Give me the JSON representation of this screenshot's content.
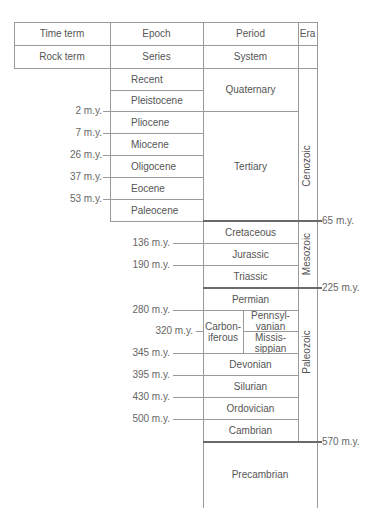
{
  "header": {
    "row1": [
      "Time term",
      "Epoch",
      "Period",
      "Era"
    ],
    "row2": [
      "Rock term",
      "Series",
      "System",
      ""
    ]
  },
  "epochs": [
    "Recent",
    "Pleistocene",
    "Pliocene",
    "Miocene",
    "Oligocene",
    "Eocene",
    "Paleocene"
  ],
  "epoch_boundaries": [
    "2 m.y.",
    "7 m.y.",
    "26 m.y.",
    "37 m.y.",
    "53 m.y."
  ],
  "periods": {
    "quaternary": "Quaternary",
    "tertiary": "Tertiary",
    "cretaceous": "Cretaceous",
    "jurassic": "Jurassic",
    "triassic": "Triassic",
    "permian": "Permian",
    "carboniferous_1": "Carbon-",
    "carboniferous_2": "iferous",
    "pennsylvanian_1": "Pennsyl-",
    "pennsylvanian_2": "vanian",
    "mississippian_1": "Missis-",
    "mississippian_2": "sippian",
    "devonian": "Devonian",
    "silurian": "Silurian",
    "ordovician": "Ordovician",
    "cambrian": "Cambrian",
    "precambrian": "Precambrian"
  },
  "period_boundaries": [
    "136 m.y.",
    "190 m.y.",
    "280 m.y.",
    "320 m.y.",
    "345 m.y.",
    "395 m.y.",
    "430 m.y.",
    "500 m.y."
  ],
  "era_boundaries": [
    "65 m.y.",
    "225 m.y.",
    "570 m.y."
  ],
  "eras": [
    "Cenozoic",
    "Mesozoic",
    "Paleozoic"
  ]
}
